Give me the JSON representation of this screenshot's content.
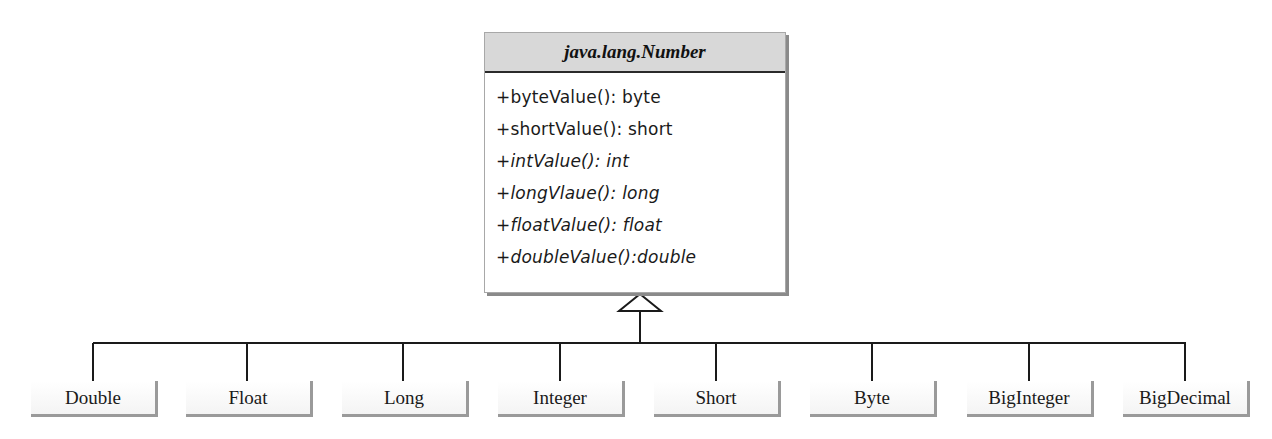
{
  "diagram": {
    "type": "uml-class-inheritance",
    "parent": {
      "name": "java.lang.Number",
      "abstract": true,
      "methods": [
        {
          "text": "+byteValue(): byte",
          "abstract": false
        },
        {
          "text": "+shortValue(): short",
          "abstract": false
        },
        {
          "text": "+intValue(): int",
          "abstract": true
        },
        {
          "text": "+longVlaue(): long",
          "abstract": true
        },
        {
          "text": "+floatValue(): float",
          "abstract": true
        },
        {
          "text": "+doubleValue():double",
          "abstract": true
        }
      ]
    },
    "relationship": "generalization",
    "children": [
      {
        "name": "Double"
      },
      {
        "name": "Float"
      },
      {
        "name": "Long"
      },
      {
        "name": "Integer"
      },
      {
        "name": "Short"
      },
      {
        "name": "Byte"
      },
      {
        "name": "BigInteger"
      },
      {
        "name": "BigDecimal"
      }
    ]
  }
}
